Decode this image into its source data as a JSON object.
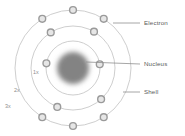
{
  "diagram": {
    "background_color": "#ffffff",
    "center": {
      "x": 73,
      "y": 68
    },
    "nucleus": {
      "label": "Nucleus",
      "radius": 16,
      "color": "#838383",
      "blurred": true
    },
    "shell_stroke_color": "#c8c8c8",
    "shell_stroke_width": 0.9,
    "electron": {
      "ring_color": "#9a9a9a",
      "fill_color": "#e6e6e6",
      "radius": 3.4,
      "ring_width": 1.4
    },
    "shells": [
      {
        "name": "1s",
        "label": "1x",
        "label_x": 33,
        "label_y": 70,
        "radius": 27,
        "electron_count": 2,
        "electron_angles": [
          170,
          8
        ]
      },
      {
        "name": "2s",
        "label": "2x",
        "label_x": 14,
        "label_y": 88,
        "radius": 42,
        "electron_count": 4,
        "electron_angles": [
          248,
          312,
          60,
          122
        ]
      },
      {
        "name": "3s",
        "label": "3x",
        "label_x": 5,
        "label_y": 104,
        "radius": 58,
        "electron_count": 6,
        "electron_angles": [
          238,
          270,
          302,
          58,
          90,
          122
        ]
      }
    ],
    "callouts": [
      {
        "id": "electron",
        "label": "Electron",
        "label_x": 144,
        "label_y": 20,
        "line_x1": 113,
        "line_y1": 23,
        "line_x2": 140,
        "line_y2": 23
      },
      {
        "id": "nucleus",
        "label": "Nucleus",
        "label_x": 144,
        "label_y": 61,
        "line_x1": 86,
        "line_y1": 62,
        "line_x2": 140,
        "line_y2": 64
      },
      {
        "id": "shell",
        "label": "Shell",
        "label_x": 144,
        "label_y": 89,
        "line_x1": 123,
        "line_y1": 92,
        "line_x2": 140,
        "line_y2": 92
      }
    ]
  }
}
